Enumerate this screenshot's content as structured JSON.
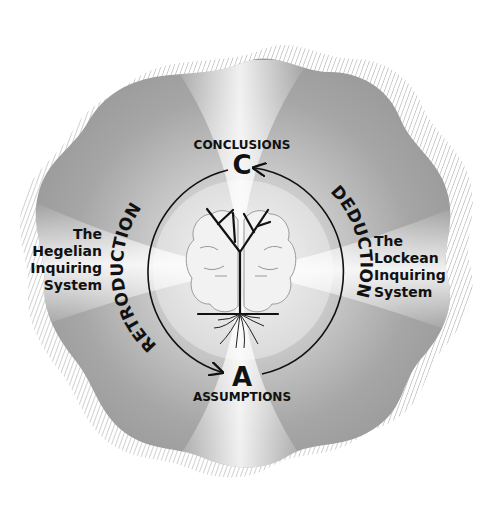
{
  "diagram": {
    "nodes": {
      "conclusions": {
        "label": "CONCLUSIONS",
        "letter": "C"
      },
      "assumptions": {
        "label": "ASSUMPTIONS",
        "letter": "A"
      }
    },
    "arcs": {
      "left": {
        "label": "RETRODUCTION",
        "direction": "from C to A"
      },
      "right": {
        "label": "DEDUCTION",
        "direction": "from A to C"
      }
    },
    "systems": {
      "left": {
        "line1": "The",
        "line2": "Hegelian",
        "line3": "Inquiring",
        "line4": "System"
      },
      "right": {
        "line1": "The",
        "line2": "Lockean",
        "line3": "Inquiring",
        "line4": "System"
      }
    },
    "center_icon": "brain-tree-icon",
    "colors": {
      "background": "#ffffff",
      "blob": "#9a9a9a",
      "ray_light": "#ececec",
      "ink": "#111111",
      "hatch": "#c8c8c8"
    }
  }
}
